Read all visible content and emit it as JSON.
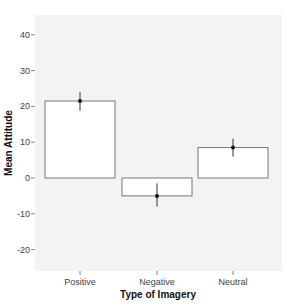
{
  "chart_data": {
    "type": "bar",
    "title": "",
    "xlabel": "Type of Imagery",
    "ylabel": "Mean Attitude",
    "categories": [
      "Positive",
      "Negative",
      "Neutral"
    ],
    "values": [
      21.5,
      -5.0,
      8.5
    ],
    "error_bars": [
      {
        "low": 18.8,
        "high": 24.0
      },
      {
        "low": -8.0,
        "high": -1.5
      },
      {
        "low": 6.0,
        "high": 11.0
      }
    ],
    "ylim": [
      -25,
      45
    ],
    "yticks": [
      -20,
      -10,
      0,
      10,
      20,
      30,
      40
    ],
    "ytick_labels": [
      "-20",
      "-10",
      "0",
      "10",
      "20",
      "30",
      "40"
    ],
    "grid": false,
    "legend": null
  },
  "colors": {
    "panel_background": "#f3f3f3",
    "bar_fill": "#ffffff",
    "bar_stroke": "#777777",
    "point_color": "#111111"
  }
}
